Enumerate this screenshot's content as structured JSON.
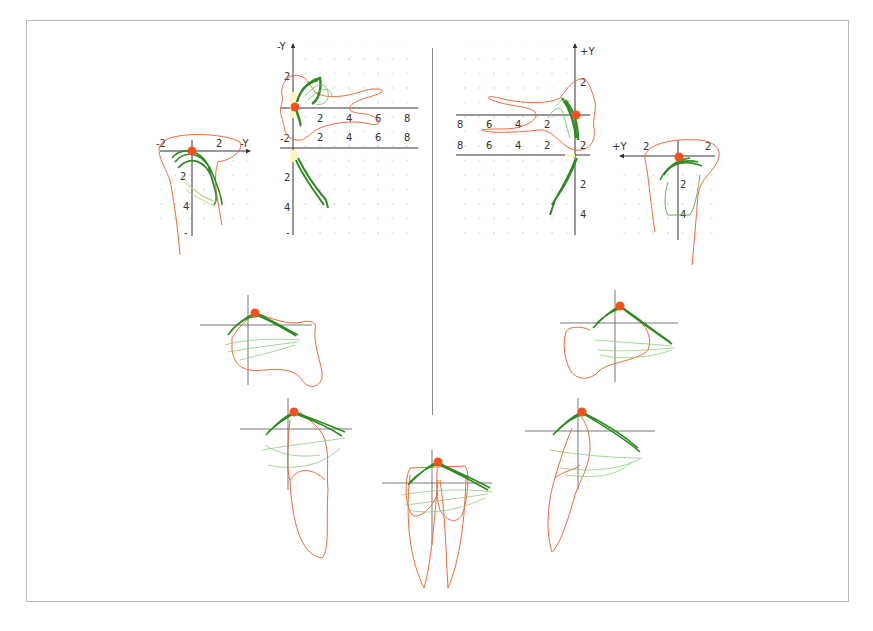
{
  "figure": {
    "frame_color": "#b8b8b8",
    "divider_color": "#8a8a8a",
    "colors": {
      "outline": "#ef6a3a",
      "trace_dark": "#2e8b22",
      "trace_light": "#7cc46a",
      "trace_pale": "#c9e6a8",
      "center_dot": "#f4511e",
      "axis": "#333333",
      "grid_dot": "#bdbdbd",
      "highlight": "#fff5c4"
    }
  },
  "panels": {
    "top_left_side": {
      "axis_label": "-Y",
      "x_ticks": [
        "-2",
        "2"
      ],
      "y_ticks": [
        "2",
        "4",
        "-"
      ]
    },
    "top_left_main": {
      "axis_label": "-Y",
      "upper_y_ticks": [
        "2",
        "-2"
      ],
      "upper_x_ticks": [
        "2",
        "4",
        "6",
        "8"
      ],
      "lower_x_ticks": [
        "2",
        "4",
        "6",
        "8"
      ],
      "lower_y_ticks": [
        "2",
        "4",
        "-"
      ]
    },
    "top_right_main": {
      "axis_label": "+Y",
      "upper_y_ticks": [
        "2",
        "2"
      ],
      "upper_x_ticks": [
        "8",
        "6",
        "4",
        "2"
      ],
      "lower_x_ticks": [
        "8",
        "6",
        "4",
        "2"
      ],
      "lower_y_ticks": [
        "2",
        "4"
      ]
    },
    "top_right_side": {
      "axis_label": "+Y",
      "x_ticks": [
        "2",
        "2"
      ],
      "y_ticks": [
        "2",
        "4"
      ]
    },
    "mid_left": {
      "label": "premolar-trace-left"
    },
    "mid_right": {
      "label": "premolar-trace-right"
    },
    "low_left": {
      "label": "canine-trace-left"
    },
    "low_center": {
      "label": "incisor-trace-center"
    },
    "low_right": {
      "label": "canine-trace-right"
    }
  }
}
